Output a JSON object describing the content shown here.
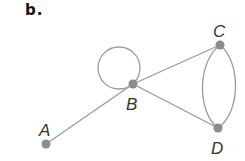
{
  "title": "b.",
  "graph": {
    "edge_color": "#9a9a9a",
    "node_color": "#8c8c8c",
    "nodes": [
      {
        "id": "A",
        "label": "A",
        "x": 46,
        "y": 144
      },
      {
        "id": "B",
        "label": "B",
        "x": 133,
        "y": 84
      },
      {
        "id": "C",
        "label": "C",
        "x": 220,
        "y": 45
      },
      {
        "id": "D",
        "label": "D",
        "x": 218,
        "y": 128
      }
    ],
    "edges": [
      {
        "from": "A",
        "to": "B"
      },
      {
        "from": "B",
        "to": "B",
        "type": "loop"
      },
      {
        "from": "B",
        "to": "C"
      },
      {
        "from": "B",
        "to": "D"
      },
      {
        "from": "C",
        "to": "D",
        "type": "curve-left"
      },
      {
        "from": "C",
        "to": "D",
        "type": "curve-right"
      }
    ]
  }
}
